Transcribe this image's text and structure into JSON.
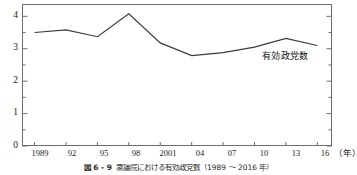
{
  "figure": {
    "caption_number": "図 6 - 9",
    "caption_text": "衆議院における有効政党数（1989 〜 2016 年）"
  },
  "axes": {
    "y_ticks": [
      "0",
      "1",
      "2",
      "3",
      "4"
    ],
    "x_ticks": [
      "1989",
      "92",
      "95",
      "98",
      "2001",
      "04",
      "07",
      "10",
      "13",
      "16"
    ],
    "x_unit_label": "（年）"
  },
  "annotations": {
    "series_label": "有効政党数"
  },
  "chart_data": {
    "type": "line",
    "title": "衆議院における有効政党数（1989 〜 2016 年）",
    "xlabel": "（年）",
    "ylabel": "",
    "categories": [
      "1989",
      "92",
      "95",
      "98",
      "2001",
      "04",
      "07",
      "10",
      "13",
      "16"
    ],
    "x": [
      1989,
      1992,
      1995,
      1998,
      2001,
      2004,
      2007,
      2010,
      2013,
      2016
    ],
    "series": [
      {
        "name": "有効政党数",
        "values": [
          3.5,
          3.58,
          3.37,
          4.08,
          3.18,
          2.79,
          2.88,
          3.05,
          3.32,
          3.1
        ]
      }
    ],
    "ylim": [
      0,
      4.38
    ],
    "xlim": [
      1987.8,
      2017.4
    ],
    "y_major_ticks": [
      0,
      1,
      2,
      3,
      4
    ],
    "y_minor_ticks": [
      0.5,
      1.5,
      2.5,
      3.5
    ],
    "grid": false,
    "legend": "none",
    "line_color": "#3a3a3a",
    "frame_color": "#6d6d6d"
  }
}
